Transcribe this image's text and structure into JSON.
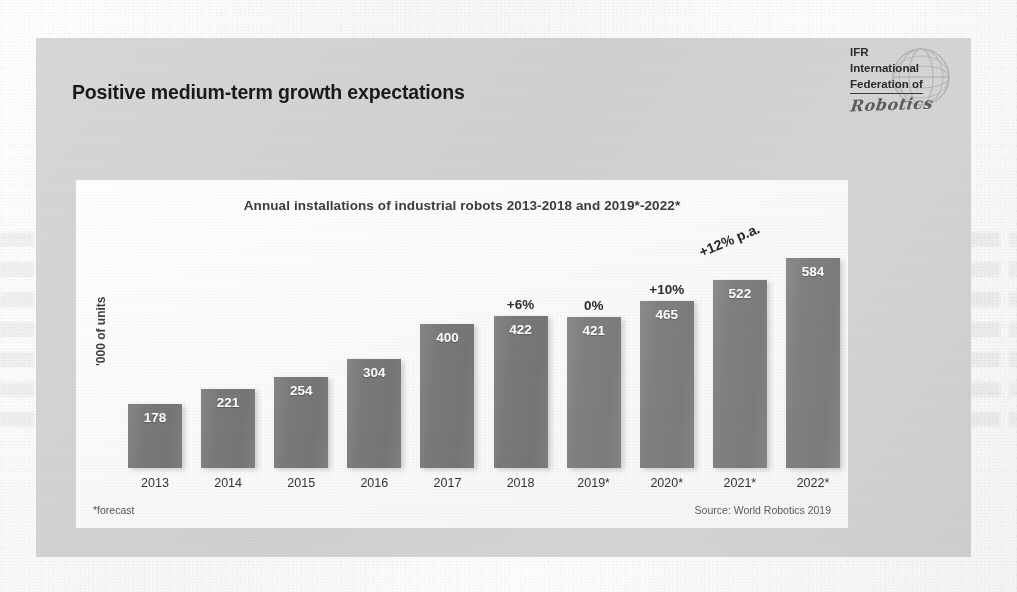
{
  "slide": {
    "title": "Positive medium-term growth expectations"
  },
  "logo": {
    "line1": "IFR",
    "line2": "International",
    "line3": "Federation of",
    "script": "Robotics",
    "globe_icon": "globe-icon"
  },
  "chart_panel": {
    "y_axis_label": "'000 of units",
    "footnote_left": "*forecast",
    "footnote_right": "Source: World Robotics 2019",
    "cagr_annotation": "+12% p.a."
  },
  "chart_data": {
    "type": "bar",
    "title": "Annual installations of industrial robots 2013-2018 and 2019*-2022*",
    "xlabel": "",
    "ylabel": "'000 of units",
    "ylim": [
      0,
      640
    ],
    "grid": false,
    "legend": "none",
    "categories": [
      "2013",
      "2014",
      "2015",
      "2016",
      "2017",
      "2018",
      "2019*",
      "2020*",
      "2021*",
      "2022*"
    ],
    "values": [
      178,
      221,
      254,
      304,
      400,
      422,
      421,
      465,
      522,
      584
    ],
    "value_labels": [
      "178",
      "221",
      "254",
      "304",
      "400",
      "422",
      "421",
      "465",
      "522",
      "584"
    ],
    "forecast_flags": [
      false,
      false,
      false,
      false,
      false,
      false,
      true,
      true,
      true,
      true
    ],
    "growth_labels": [
      "",
      "",
      "",
      "",
      "",
      "+6%",
      "0%",
      "+10%",
      "",
      ""
    ],
    "annotations": [
      {
        "text": "+12% p.a.",
        "target": "2019*-2022*",
        "rotation_deg": -23
      }
    ],
    "notes": [
      "*forecast"
    ],
    "source": "Source: World Robotics 2019"
  },
  "colors": {
    "page": "#fbfbfb",
    "slide_bg": "#d4d4d4",
    "panel_bg": "#fdfdfd",
    "bar": "#7c7c7c",
    "bar_forecast": "#828282",
    "title_text": "#1a1a1a",
    "value_text": "#ffffff",
    "growth_text": "#2e2e2e"
  }
}
